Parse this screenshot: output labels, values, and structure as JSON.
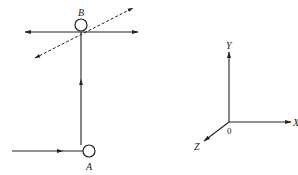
{
  "diagram": {
    "type": "mechanics-path-diagram",
    "nodes": [
      {
        "id": "B",
        "label": "B",
        "cx": 81,
        "cy": 25,
        "r": 6
      },
      {
        "id": "A",
        "label": "A",
        "cx": 89,
        "cy": 151,
        "r": 6
      }
    ],
    "lines": [
      {
        "id": "horizontal-through-B",
        "style": "solid",
        "x1": 25,
        "y1": 32,
        "x2": 138,
        "y2": 32,
        "arrows": "both"
      },
      {
        "id": "dashed-diagonal-through-B",
        "style": "dashed",
        "x1": 35,
        "y1": 58,
        "x2": 133,
        "y2": 8,
        "arrows": "both"
      },
      {
        "id": "vertical-A-to-B",
        "style": "solid",
        "x1": 81,
        "y1": 145,
        "x2": 81,
        "y2": 32,
        "mid_arrow": "up"
      },
      {
        "id": "incoming-to-A",
        "style": "solid",
        "x1": 12,
        "y1": 151,
        "x2": 83,
        "y2": 151,
        "mid_arrow": "right"
      }
    ],
    "axes": {
      "origin": {
        "x": 229,
        "y": 122,
        "label": "0"
      },
      "x_axis": {
        "label": "X",
        "end": {
          "x": 291,
          "y": 122
        }
      },
      "y_axis": {
        "label": "Y",
        "end": {
          "x": 229,
          "y": 52
        }
      },
      "z_axis": {
        "label": "Z",
        "end": {
          "x": 204,
          "y": 141
        }
      }
    },
    "colors": {
      "stroke": "#222222",
      "background": "#ffffff"
    }
  }
}
